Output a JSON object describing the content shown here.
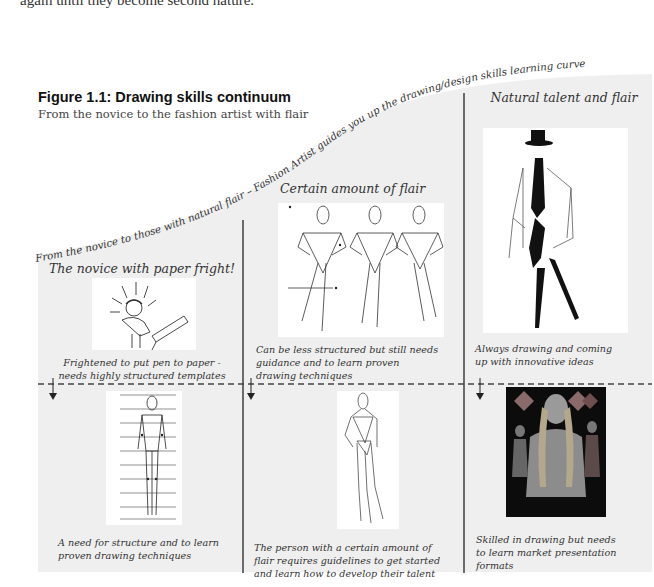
{
  "page": {
    "top_text": "again until they become second nature."
  },
  "figure": {
    "title": "Figure 1.1: Drawing skills continuum",
    "subtitle": "From the novice to the fashion artist with flair",
    "curve_text": "From the novice to those with natural flair – Fashion Artist guides you up the drawing/design skills learning curve",
    "colors": {
      "panel_bg": "#efefef",
      "divider": "#333333",
      "dashed_line": "#444444",
      "text": "#333333"
    },
    "columns": [
      {
        "heading": "The novice with paper fright!",
        "top_image": "cartoon-frightened-novice-at-drawing-board",
        "top_caption_lines": [
          "Frightened to put pen to paper -",
          "needs highly structured templates"
        ],
        "bottom_image": "structured-croquis-template-with-grid-lines",
        "bottom_caption_lines": [
          "A need for structure and to learn",
          "proven drawing techniques"
        ]
      },
      {
        "heading": "Certain amount of flair",
        "top_image": "three-stick-figure-fashion-poses",
        "top_caption_lines": [
          "Can be less structured but still needs",
          "guidance and to learn proven",
          "drawing techniques"
        ],
        "bottom_image": "fashion-croquis-figure-hand-on-hip",
        "bottom_caption_lines": [
          "The person with a certain amount of",
          "flair requires guidelines to get started",
          "and learn how to develop their talent"
        ]
      },
      {
        "heading": "Natural talent and flair",
        "top_image": "expressive-ink-fashion-sketch-figure-with-hat",
        "top_caption_lines": [
          "Always drawing and coming",
          "up with innovative ideas"
        ],
        "bottom_image": "fashion-presentation-board-dark",
        "bottom_caption_lines": [
          "Skilled in drawing but needs",
          "to learn market presentation",
          "formats"
        ]
      }
    ],
    "icons": {
      "down_arrow": "down-arrow-icon"
    }
  }
}
